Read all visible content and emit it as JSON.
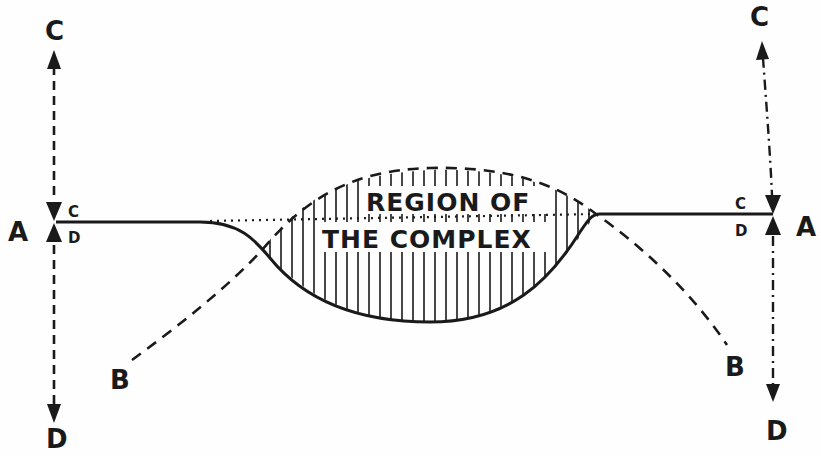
{
  "diagram": {
    "title": "Region of the complex",
    "colors": {
      "ink": "#1a1a1a",
      "paper": "#fefefe"
    },
    "labels": {
      "left_top_C": "C",
      "left_A": "A",
      "left_small_C": "C",
      "left_small_D": "D",
      "left_bottom_D": "D",
      "left_B": "B",
      "right_top_C": "C",
      "right_A": "A",
      "right_small_C": "C",
      "right_small_D": "D",
      "right_bottom_D": "D",
      "right_B": "B",
      "region_line1": "REGION OF",
      "region_line2": "THE COMPLEX"
    },
    "elements": {
      "left_axis": "dashed vertical double arrow C-D at left A",
      "right_axis": "dash-dot vertical double arrow C-D at right A",
      "curve_A": "solid line A to A with downward trough",
      "curve_B": "dashed arc B to B with upward hump",
      "baseline": "dotted straight line across region",
      "hatching": "vertical hatch lines between curves"
    }
  }
}
